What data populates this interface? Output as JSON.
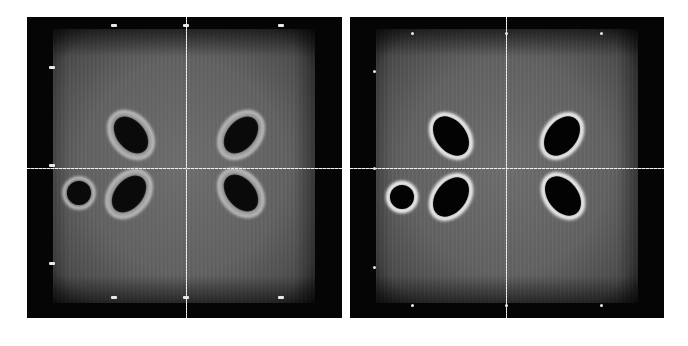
{
  "figure": {
    "panels": [
      {
        "id": "left",
        "description": "Reconstructed cross-section with halo artifacts",
        "background_color": "#050505",
        "field_color": "#666666",
        "crosshair": {
          "x": 159,
          "y": 151,
          "color": "#f0f0f0"
        },
        "markers": [
          {
            "pos": "top-left",
            "x": 84,
            "y": 7
          },
          {
            "pos": "top-center",
            "x": 156,
            "y": 7
          },
          {
            "pos": "top-right",
            "x": 251,
            "y": 7
          },
          {
            "pos": "left-upper",
            "x": 22,
            "y": 49
          },
          {
            "pos": "left-middle",
            "x": 22,
            "y": 147
          },
          {
            "pos": "left-lower",
            "x": 22,
            "y": 245
          },
          {
            "pos": "bottom-left",
            "x": 84,
            "y": 279
          },
          {
            "pos": "bottom-center",
            "x": 156,
            "y": 279
          },
          {
            "pos": "bottom-right",
            "x": 251,
            "y": 279
          }
        ],
        "objects": [
          {
            "shape": "ellipse",
            "cx": 104,
            "cy": 118,
            "rx": 15,
            "ry": 22,
            "rotate": -40,
            "ring": "double"
          },
          {
            "shape": "ellipse",
            "cx": 214,
            "cy": 118,
            "rx": 15,
            "ry": 22,
            "rotate": 40,
            "ring": "double"
          },
          {
            "shape": "ellipse",
            "cx": 102,
            "cy": 177,
            "rx": 15,
            "ry": 22,
            "rotate": 40,
            "ring": "double"
          },
          {
            "shape": "ellipse",
            "cx": 214,
            "cy": 176,
            "rx": 15,
            "ry": 22,
            "rotate": -40,
            "ring": "double"
          },
          {
            "shape": "circle",
            "cx": 52,
            "cy": 176,
            "r": 12,
            "ring": "single"
          }
        ]
      },
      {
        "id": "right",
        "description": "Reconstructed cross-section, sharper edges",
        "background_color": "#050505",
        "field_color": "#666666",
        "crosshair": {
          "x": 156,
          "y": 151,
          "color": "#f0f0f0"
        },
        "markers": [
          {
            "pos": "top-left",
            "x": 61,
            "y": 15
          },
          {
            "pos": "top-center",
            "x": 155,
            "y": 15
          },
          {
            "pos": "top-right",
            "x": 250,
            "y": 15
          },
          {
            "pos": "left-upper",
            "x": 23,
            "y": 53
          },
          {
            "pos": "left-middle",
            "x": 23,
            "y": 150
          },
          {
            "pos": "left-lower",
            "x": 23,
            "y": 249
          },
          {
            "pos": "bottom-left",
            "x": 61,
            "y": 287
          },
          {
            "pos": "bottom-center",
            "x": 155,
            "y": 287
          },
          {
            "pos": "bottom-right",
            "x": 250,
            "y": 287
          }
        ],
        "objects": [
          {
            "shape": "ellipse",
            "cx": 101,
            "cy": 119,
            "rx": 14,
            "ry": 21,
            "rotate": -38,
            "ring": "bright"
          },
          {
            "shape": "ellipse",
            "cx": 212,
            "cy": 119,
            "rx": 14,
            "ry": 21,
            "rotate": 38,
            "ring": "bright"
          },
          {
            "shape": "ellipse",
            "cx": 101,
            "cy": 180,
            "rx": 14,
            "ry": 21,
            "rotate": 38,
            "ring": "bright"
          },
          {
            "shape": "ellipse",
            "cx": 213,
            "cy": 179,
            "rx": 14,
            "ry": 21,
            "rotate": -38,
            "ring": "bright"
          },
          {
            "shape": "circle",
            "cx": 52,
            "cy": 180,
            "r": 11,
            "ring": "bright"
          }
        ]
      }
    ]
  }
}
